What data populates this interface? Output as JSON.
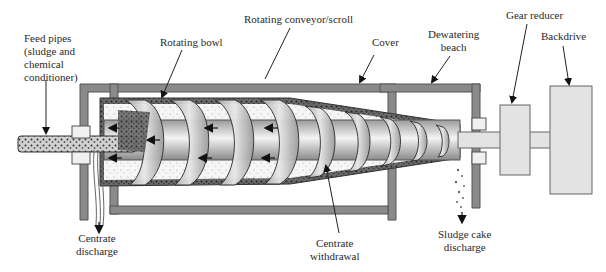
{
  "diagram": {
    "labels": {
      "feed_pipes": [
        "Feed pipes",
        "(sludge and",
        "chemical",
        "conditioner)"
      ],
      "rotating_bowl": "Rotating bowl",
      "rotating_conveyor": "Rotating conveyor/scroll",
      "cover": "Cover",
      "dewatering_beach": [
        "Dewatering",
        "beach"
      ],
      "gear_reducer": "Gear reducer",
      "backdrive": "Backdrive",
      "centrate_discharge": [
        "Centrate",
        "discharge"
      ],
      "centrate_withdrawal": [
        "Centrate",
        "withdrawal"
      ],
      "sludge_cake_discharge": [
        "Sludge cake",
        "discharge"
      ]
    },
    "colors": {
      "frame": "#8a8a8a",
      "frame_edge": "#555555",
      "bowl_fill": "#d8d8d8",
      "sludge_dark": "#4a4a4a",
      "solids_light": "#f2f2f2",
      "drive_fill": "#e3e3e3",
      "arrow": "#111111"
    }
  }
}
